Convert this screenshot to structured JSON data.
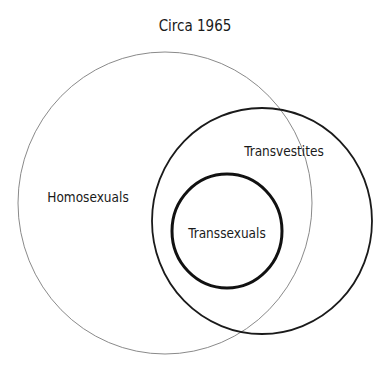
{
  "title": "Circa 1965",
  "sets": [
    {
      "id": "homosexuals",
      "label": "Homosexuals",
      "cx": 165,
      "cy": 203,
      "rx": 147,
      "ry": 151,
      "stroke": "#8a8a8a",
      "stroke_width": 1,
      "label_x": 88,
      "label_y": 197
    },
    {
      "id": "transvestites",
      "label": "Transvestites",
      "cx": 262,
      "cy": 221,
      "rx": 110,
      "ry": 113,
      "stroke": "#1a1a1a",
      "stroke_width": 1.8,
      "label_x": 284,
      "label_y": 151
    },
    {
      "id": "transsexuals",
      "label": "Transsexuals",
      "cx": 227,
      "cy": 231,
      "rx": 55,
      "ry": 57,
      "stroke": "#111111",
      "stroke_width": 3,
      "label_x": 227,
      "label_y": 233
    }
  ],
  "colors": {
    "background": "#ffffff",
    "text": "#1a1a1a"
  }
}
